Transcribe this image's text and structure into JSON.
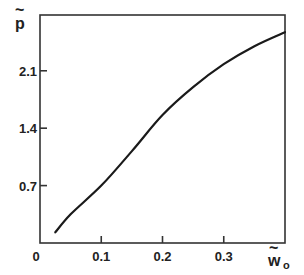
{
  "chart_data": {
    "type": "line",
    "title": "",
    "xlabel": "w̃o",
    "ylabel": "p̃",
    "xlim": [
      0,
      0.4
    ],
    "ylim": [
      0,
      2.78
    ],
    "grid": false,
    "legend": null,
    "x_ticks": [
      0,
      0.1,
      0.2,
      0.3
    ],
    "x_tick_labels": [
      "0",
      "0.1",
      "0.2",
      "0.3"
    ],
    "y_ticks": [
      0.7,
      1.4,
      2.1
    ],
    "y_tick_labels": [
      "0.7",
      "1.4",
      "2.1"
    ],
    "series": [
      {
        "name": "p̃(w̃o)",
        "x": [
          0.025,
          0.05,
          0.1,
          0.15,
          0.2,
          0.25,
          0.3,
          0.35,
          0.4
        ],
        "values": [
          0.13,
          0.35,
          0.7,
          1.12,
          1.56,
          1.9,
          2.18,
          2.4,
          2.57
        ]
      }
    ]
  },
  "labels": {
    "y_axis_main": "p",
    "y_axis_tilde": "~",
    "x_axis_main": "w",
    "x_axis_tilde": "~",
    "x_axis_sub": "o",
    "origin": "0"
  },
  "colors": {
    "line": "#1a1a1a",
    "axis": "#333333"
  }
}
